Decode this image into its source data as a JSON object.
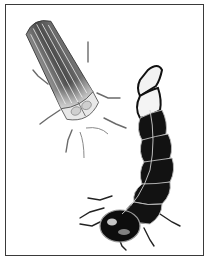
{
  "illustration": {
    "subjects": [
      "adult-firefly",
      "firefly-larva"
    ],
    "colors": {
      "frame": "#3a3a3a",
      "background": "#ffffff",
      "adult_body": "#6a6a6a",
      "adult_stripes": "#d8d8d8",
      "larva_body": "#111111",
      "larva_highlight": "#e6e6e6"
    }
  }
}
